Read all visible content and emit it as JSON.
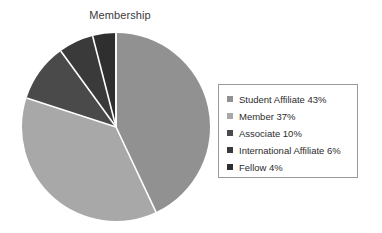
{
  "chart_data": {
    "type": "pie",
    "title": "Membership",
    "categories": [
      "Student Affiliate",
      "Member",
      "Associate",
      "International Affiliate",
      "Fellow"
    ],
    "values": [
      43,
      37,
      10,
      6,
      4
    ],
    "value_unit": "%",
    "legend_position": "right",
    "grid": false,
    "start_angle_deg": 0,
    "direction": "clockwise",
    "slice_colors": [
      "#919191",
      "#a8a8a8",
      "#4a4a4a",
      "#3a3a3a",
      "#2f2f2f"
    ],
    "separator_color": "#ffffff",
    "legend_entries": [
      {
        "label": "Student Affiliate 43%",
        "color": "#919191"
      },
      {
        "label": "Member 37%",
        "color": "#a8a8a8"
      },
      {
        "label": "Associate 10%",
        "color": "#4a4a4a"
      },
      {
        "label": "International Affiliate 6%",
        "color": "#3a3a3a"
      },
      {
        "label": "Fellow 4%",
        "color": "#2f2f2f"
      }
    ]
  }
}
